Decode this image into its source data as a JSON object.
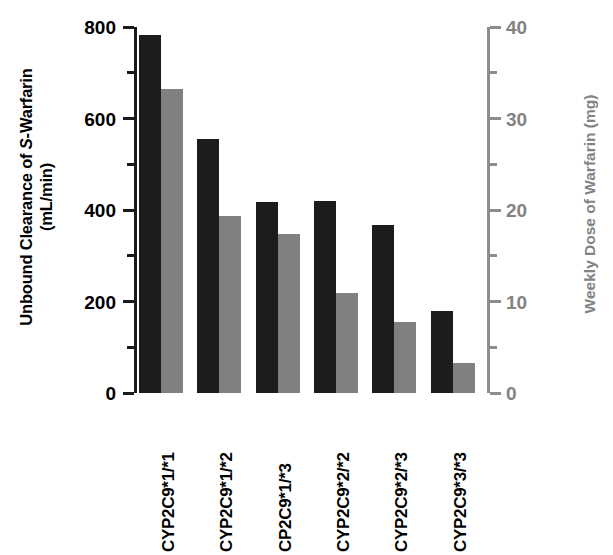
{
  "chart_data": {
    "type": "bar",
    "title": "",
    "categories": [
      "CYP2C9*1/*1",
      "CYP2C9*1/*2",
      "CP2C9*1/*3",
      "CYP2C9*2/*2",
      "CYP2C9*2/*3",
      "CYP2C9*3/*3"
    ],
    "series": [
      {
        "name": "Unbound Clearance of S-Warfarin (mL/min)",
        "axis": "left",
        "color": "#1c1c1c",
        "values": [
          783,
          555,
          418,
          420,
          368,
          180
        ]
      },
      {
        "name": "Weekly Dose of Warfarin (mg)",
        "axis": "right",
        "color": "#808080",
        "values": [
          33.2,
          19.3,
          17.4,
          10.9,
          7.8,
          3.3
        ]
      }
    ],
    "xlabel": "",
    "ylabel_left_line1_pre": "Unbound Clearance of ",
    "ylabel_left_italic": "S",
    "ylabel_left_line1_post": "-Warfarin",
    "ylabel_left_line2": "(mL/min)",
    "ylabel_right": "Weekly Dose of Warfarin (mg)",
    "ylim_left": [
      0,
      800
    ],
    "ylim_right": [
      0,
      40
    ],
    "yticks_left": [
      "0",
      "200",
      "400",
      "600",
      "800"
    ],
    "yticks_left_values": [
      0,
      200,
      400,
      600,
      800
    ],
    "yticks_left_minor": [
      100,
      300,
      500,
      700
    ],
    "yticks_right": [
      "0",
      "10",
      "20",
      "30",
      "40"
    ],
    "yticks_right_values": [
      0,
      10,
      20,
      30,
      40
    ],
    "yticks_right_minor": [
      5,
      15,
      25,
      35
    ],
    "grid": false,
    "legend": "none",
    "axis_color_left": "#1a1a1a",
    "axis_color_right": "#8c8c8c"
  }
}
